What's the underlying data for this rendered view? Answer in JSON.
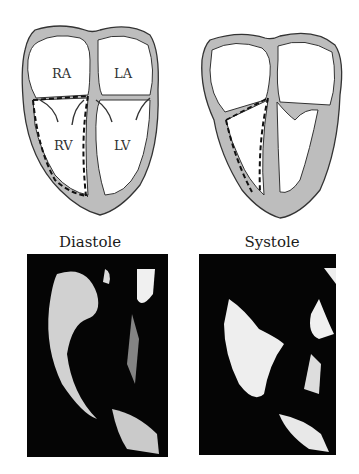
{
  "figure": {
    "panels": [
      {
        "phase": "Diastole",
        "chambers": {
          "right_atrium": "RA",
          "left_atrium": "LA",
          "right_ventricle": "RV",
          "left_ventricle": "LV"
        },
        "echo_image": "echocardiogram-diastole"
      },
      {
        "phase": "Systole",
        "chambers": {},
        "echo_image": "echocardiogram-systole"
      }
    ],
    "colors": {
      "myocardium": "#b8b8b8",
      "outline": "#333333",
      "echo_background": "#050505",
      "echo_signal": "#f0f0f0"
    }
  }
}
